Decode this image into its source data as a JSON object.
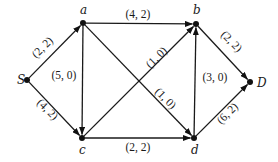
{
  "diagram": {
    "type": "flow-network",
    "label_format": "(capacity, flow)",
    "nodes": [
      {
        "id": "S",
        "label": "S",
        "x": 27,
        "y": 80,
        "lx": 17,
        "ly": 84
      },
      {
        "id": "a",
        "label": "a",
        "x": 83,
        "y": 23,
        "lx": 80,
        "ly": 14
      },
      {
        "id": "b",
        "label": "b",
        "x": 196,
        "y": 24,
        "lx": 193,
        "ly": 14
      },
      {
        "id": "c",
        "label": "c",
        "x": 82,
        "y": 138,
        "lx": 79,
        "ly": 154
      },
      {
        "id": "d",
        "label": "d",
        "x": 194,
        "y": 138,
        "lx": 191,
        "ly": 154
      },
      {
        "id": "D",
        "label": "D",
        "x": 250,
        "y": 82,
        "lx": 257,
        "ly": 87
      }
    ],
    "edges": [
      {
        "from": "S",
        "to": "a",
        "label": "(2, 2)",
        "capacity": 2,
        "flow": 2,
        "tx": 45,
        "ty": 50,
        "rot": -45
      },
      {
        "from": "S",
        "to": "c",
        "label": "(4, 2)",
        "capacity": 4,
        "flow": 2,
        "tx": 45,
        "ty": 112,
        "rot": 45
      },
      {
        "from": "a",
        "to": "b",
        "label": "(4, 2)",
        "capacity": 4,
        "flow": 2,
        "tx": 138,
        "ty": 18,
        "rot": 0
      },
      {
        "from": "a",
        "to": "c",
        "label": "(5, 0)",
        "capacity": 5,
        "flow": 0,
        "tx": 64,
        "ty": 79,
        "rot": 0
      },
      {
        "from": "a",
        "to": "d",
        "label": "(1, 0)",
        "capacity": 1,
        "flow": 0,
        "tx": 163,
        "ty": 101,
        "rot": 45
      },
      {
        "from": "c",
        "to": "b",
        "label": "(1, 0)",
        "capacity": 1,
        "flow": 0,
        "tx": 159,
        "ty": 60,
        "rot": -45
      },
      {
        "from": "c",
        "to": "d",
        "label": "(2, 2)",
        "capacity": 2,
        "flow": 2,
        "tx": 138,
        "ty": 151,
        "rot": 0
      },
      {
        "from": "d",
        "to": "b",
        "label": "(3, 0)",
        "capacity": 3,
        "flow": 0,
        "tx": 215,
        "ty": 81,
        "rot": 0
      },
      {
        "from": "b",
        "to": "D",
        "label": "(2, 2)",
        "capacity": 2,
        "flow": 2,
        "tx": 229,
        "ty": 44,
        "rot": 45
      },
      {
        "from": "d",
        "to": "D",
        "label": "(6, 2)",
        "capacity": 6,
        "flow": 2,
        "tx": 230,
        "ty": 116,
        "rot": -45
      }
    ]
  }
}
